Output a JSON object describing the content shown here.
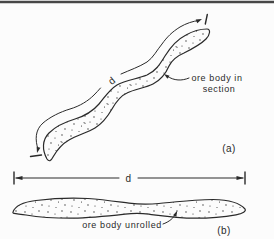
{
  "figure": {
    "background": "#fcfcfc",
    "ink": "#2a2a2a",
    "top_rule_color": "#474747",
    "panel_a": {
      "dimension_label": "d",
      "callout_line1": "ore body in",
      "callout_line2": "section",
      "panel_label": "(a)"
    },
    "unrolled_dimension": {
      "label": "d"
    },
    "panel_b": {
      "callout": "ore body unrolled",
      "panel_label": "(b)"
    }
  }
}
